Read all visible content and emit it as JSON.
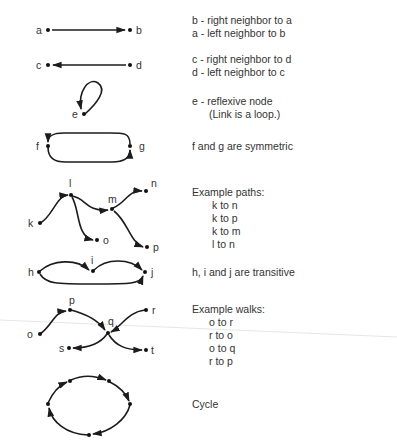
{
  "diagrams": [
    {
      "id": "neighbors-ab",
      "nodes": [
        "a",
        "b"
      ],
      "description": [
        "b - right neighbor to a",
        "a - left neighbor to b"
      ]
    },
    {
      "id": "neighbors-cd",
      "nodes": [
        "c",
        "d"
      ],
      "description": [
        "c - right neighbor to d",
        "d - left neighbor to c"
      ]
    },
    {
      "id": "reflexive",
      "nodes": [
        "e"
      ],
      "description": [
        "e - reflexive node",
        "(Link is a loop.)"
      ]
    },
    {
      "id": "symmetric",
      "nodes": [
        "f",
        "g"
      ],
      "description": [
        "f and g are symmetric"
      ]
    },
    {
      "id": "paths",
      "nodes": [
        "k",
        "l",
        "m",
        "n",
        "o",
        "p"
      ],
      "description_title": "Example paths:",
      "examples": [
        "k to n",
        "k to p",
        "k to m",
        "l to n"
      ]
    },
    {
      "id": "transitive",
      "nodes": [
        "h",
        "i",
        "j"
      ],
      "description": [
        "h, i and j are transitive"
      ]
    },
    {
      "id": "walks",
      "nodes": [
        "o",
        "p",
        "q",
        "r",
        "s",
        "t"
      ],
      "description_title": "Example walks:",
      "examples": [
        "o to r",
        "r to o",
        "o to q",
        "r to p"
      ]
    },
    {
      "id": "cycle",
      "nodes": [],
      "description": [
        "Cycle"
      ]
    }
  ],
  "labels": {
    "a": "a",
    "b": "b",
    "c": "c",
    "d": "d",
    "e": "e",
    "f": "f",
    "g": "g",
    "h": "h",
    "i": "i",
    "j": "j",
    "k": "k",
    "l": "l",
    "m": "m",
    "n": "n",
    "o1": "o",
    "p1": "p",
    "o2": "o",
    "p2": "p",
    "q": "q",
    "r": "r",
    "s": "s",
    "t": "t"
  },
  "colors": {
    "ink": "#1c1c1c",
    "text": "#333333",
    "background": "#ffffff",
    "fold_line": "#e3e3e3"
  }
}
